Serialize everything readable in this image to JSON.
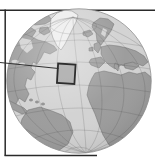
{
  "map": {
    "type": "orthographic-globe-locator",
    "view": "North Atlantic centered globe",
    "regions_visible": [
      "North America",
      "Greenland",
      "Arctic islands",
      "Iceland",
      "British Isles",
      "Scandinavia",
      "Europe",
      "Iberian Peninsula",
      "Mediterranean Sea",
      "Africa",
      "South America",
      "Caribbean",
      "Atlantic Ocean"
    ],
    "highlight": {
      "shape": "square",
      "location": "mid-North-Atlantic west of Iberia",
      "has_leader_line_from_left_edge": true
    },
    "graticule": true
  },
  "colors": {
    "background": "#ffffff",
    "ocean": "#d3d3d3",
    "land": "#9d9d9d",
    "land_outline": "#6e6e6e",
    "greenland": "#ededed",
    "greenland_outline": "#7a7a7a",
    "graticule": "rgba(70,70,70,0.38)",
    "globe_rim": "#8f8f8f",
    "highlight_fill": "rgba(45,45,45,0.22)",
    "highlight_border": "#2e2e2e",
    "frame_line": "#2a2a2a",
    "leader_line": "#333333"
  }
}
